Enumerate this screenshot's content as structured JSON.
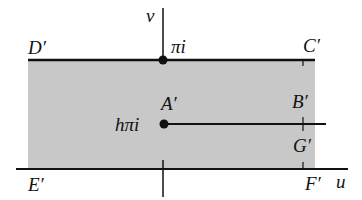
{
  "diagram": {
    "colors": {
      "region_fill": "#c8c8c8",
      "line": "#111111",
      "background": "#ffffff"
    },
    "axes": {
      "v_label": "v",
      "u_label": "u"
    },
    "points": {
      "D": "D′",
      "C": "C′",
      "A": "A′",
      "B": "B′",
      "G": "G′",
      "E": "E′",
      "F": "F′"
    },
    "values": {
      "top": "πi",
      "slit": "hπi"
    }
  }
}
